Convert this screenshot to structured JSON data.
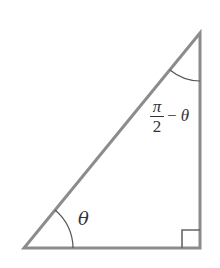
{
  "diagram": {
    "type": "right-triangle",
    "vertices": {
      "bottom_left": [
        24,
        248
      ],
      "bottom_right": [
        200,
        248
      ],
      "top_right": [
        200,
        33
      ]
    },
    "stroke_color": "#8c8c8c",
    "arc_color": "#555555",
    "right_angle_marker": {
      "x": 182,
      "y": 230,
      "size": 18
    },
    "angles": [
      {
        "id": "theta",
        "label": "θ",
        "vertex": "bottom_left"
      },
      {
        "id": "complement",
        "label_numerator": "π",
        "label_denominator": "2",
        "label_suffix_minus": "−",
        "label_suffix_var": "θ",
        "vertex": "top_right"
      }
    ]
  }
}
